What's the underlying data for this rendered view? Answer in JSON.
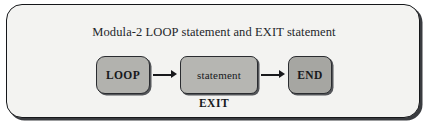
{
  "figure": {
    "title": "Modula-2 LOOP statement and EXIT statement",
    "caption": "EXIT",
    "nodes": [
      {
        "id": "loop",
        "label": "LOOP",
        "shape": "rounded-rect",
        "fill": "#b2b2ae"
      },
      {
        "id": "statement",
        "label": "statement",
        "shape": "rounded-rect",
        "fill": "#b6b6b2"
      },
      {
        "id": "end",
        "label": "END",
        "shape": "rounded-rect",
        "fill": "#a6a6a2"
      }
    ],
    "connectors": [
      {
        "id": "arrow-loop-to-statement",
        "from": "loop",
        "to": "statement",
        "direction": "right"
      },
      {
        "id": "arrow-statement-to-end",
        "from": "statement",
        "to": "end",
        "direction": "right"
      }
    ],
    "colors": {
      "panel_background": "#f3f3f1",
      "panel_border": "#15171a",
      "node_border": "#2a2c30",
      "text": "#17191c",
      "arrow": "#18191c"
    }
  }
}
